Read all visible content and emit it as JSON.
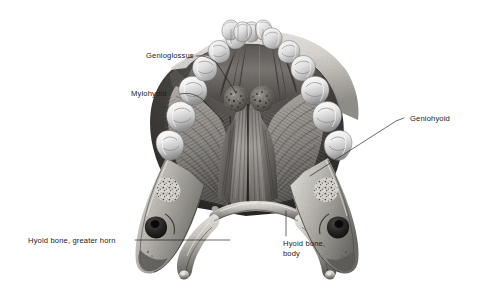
{
  "figure": {
    "background_color": "#ffffff",
    "label_color": "#1b1b1b",
    "leader_color": "#1b1b1b"
  },
  "labels": {
    "genioglossus": "Genioglossus",
    "mylohyoid": "Mylohyoid",
    "geniohyoid": "Geniohyoid",
    "hyoid_greater_horn": "Hyoid bone, greater horn",
    "hyoid_body_line1": "Hyoid bone,",
    "hyoid_body_line2": "body"
  },
  "structures": [
    {
      "name": "mandible",
      "description": "Mandible, superior view with dental arch"
    },
    {
      "name": "dental-arch",
      "description": "Lower teeth: incisors, canines, premolars, molars"
    },
    {
      "name": "genial-tubercles",
      "description": "Paired mental spines (genial tubercles)"
    },
    {
      "name": "genioglossus-muscle",
      "description": "Genioglossus muscle fanning from mental spine"
    },
    {
      "name": "mylohyoid-muscle",
      "description": "Mylohyoid muscle forming floor of mouth"
    },
    {
      "name": "geniohyoid-muscle",
      "description": "Geniohyoid muscle running to hyoid body"
    },
    {
      "name": "hyoid-bone",
      "description": "Hyoid bone with body and greater horns"
    },
    {
      "name": "mandibular-ramus-left",
      "description": "Cut left ramus showing cancellous bone"
    },
    {
      "name": "mandibular-ramus-right",
      "description": "Cut right ramus showing cancellous bone"
    }
  ]
}
